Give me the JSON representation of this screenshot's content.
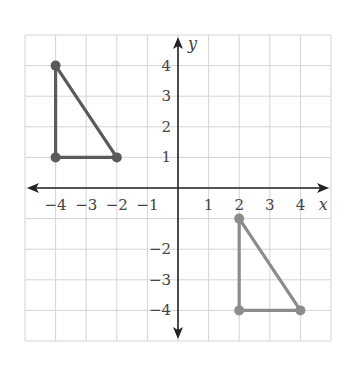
{
  "diagram": {
    "type": "coordinate-plane",
    "x_range": [
      -5,
      5
    ],
    "y_range": [
      -5,
      5
    ],
    "grid": true,
    "axis_labels": {
      "x": "x",
      "y": "y"
    },
    "x_ticks": [
      {
        "value": -4,
        "label": "−4"
      },
      {
        "value": -3,
        "label": "−3"
      },
      {
        "value": -2,
        "label": "−2"
      },
      {
        "value": -1,
        "label": "−1"
      },
      {
        "value": 1,
        "label": "1"
      },
      {
        "value": 2,
        "label": "2"
      },
      {
        "value": 3,
        "label": "3"
      },
      {
        "value": 4,
        "label": "4"
      }
    ],
    "y_ticks": [
      {
        "value": 4,
        "label": "4"
      },
      {
        "value": 3,
        "label": "3"
      },
      {
        "value": 2,
        "label": "2"
      },
      {
        "value": 1,
        "label": "1"
      },
      {
        "value": -2,
        "label": "−2"
      },
      {
        "value": -3,
        "label": "−3"
      },
      {
        "value": -4,
        "label": "−4"
      }
    ],
    "shapes": [
      {
        "name": "triangle-original",
        "vertices": [
          [
            -4,
            4
          ],
          [
            -4,
            1
          ],
          [
            -2,
            1
          ]
        ],
        "color": "#5a5a5a"
      },
      {
        "name": "triangle-image",
        "vertices": [
          [
            2,
            -1
          ],
          [
            2,
            -4
          ],
          [
            4,
            -4
          ]
        ],
        "color": "#8c8c8c"
      }
    ]
  }
}
